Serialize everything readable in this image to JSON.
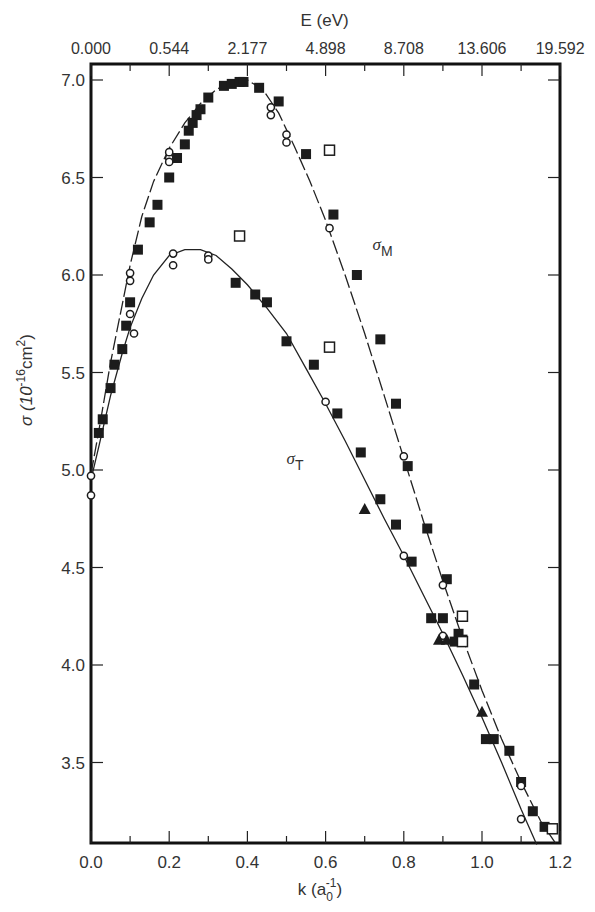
{
  "chart_data": {
    "type": "scatter",
    "title": "",
    "xlabel": "k (a0^-1)",
    "xlabel_main": "k (a",
    "xlabel_sub": "0",
    "xlabel_sup": "-1",
    "xlabel_close": ")",
    "ylabel": "σ (10^-16 cm^2)",
    "ylabel_main": "σ (10",
    "ylabel_sup": "-16",
    "ylabel_unit": "cm",
    "ylabel_unit_sup": "2",
    "ylabel_close": ")",
    "top_axis_label": "E (eV)",
    "xlim": [
      0.0,
      1.2
    ],
    "ylim": [
      3.1,
      7.1
    ],
    "grid": false,
    "x_ticks": [
      "0.0",
      "0.2",
      "0.4",
      "0.6",
      "0.8",
      "1.0",
      "1.2"
    ],
    "x_tick_values": [
      0.0,
      0.2,
      0.4,
      0.6,
      0.8,
      1.0,
      1.2
    ],
    "y_ticks": [
      "3.5",
      "4.0",
      "4.5",
      "5.0",
      "5.5",
      "6.0",
      "6.5",
      "7.0"
    ],
    "y_tick_values": [
      3.5,
      4.0,
      4.5,
      5.0,
      5.5,
      6.0,
      6.5,
      7.0
    ],
    "top_ticks": [
      "0.000",
      "0.544",
      "2.177",
      "4.898",
      "8.708",
      "13.606",
      "19.592"
    ],
    "top_tick_k": [
      0.0,
      0.2,
      0.4,
      0.6,
      0.8,
      1.0,
      1.2
    ],
    "annotations": [
      {
        "text": "σ",
        "sub": "M",
        "x": 0.72,
        "y": 6.13
      },
      {
        "text": "σ",
        "sub": "T",
        "x": 0.5,
        "y": 5.03
      }
    ],
    "curves": [
      {
        "name": "σM fit",
        "style": "dashed-solid",
        "x": [
          0.0,
          0.02,
          0.05,
          0.08,
          0.1,
          0.13,
          0.16,
          0.2,
          0.24,
          0.28,
          0.32,
          0.36,
          0.4,
          0.44,
          0.48,
          0.52,
          0.56,
          0.6,
          0.65,
          0.7,
          0.75,
          0.8,
          0.85,
          0.9,
          0.95,
          1.0,
          1.05,
          1.1,
          1.15,
          1.19
        ],
        "y": [
          4.98,
          5.2,
          5.55,
          5.85,
          6.05,
          6.3,
          6.48,
          6.65,
          6.78,
          6.88,
          6.95,
          6.99,
          7.0,
          6.95,
          6.83,
          6.66,
          6.48,
          6.28,
          6.0,
          5.7,
          5.38,
          5.06,
          4.74,
          4.43,
          4.14,
          3.87,
          3.62,
          3.4,
          3.2,
          3.08
        ]
      },
      {
        "name": "σT fit",
        "style": "solid",
        "x": [
          0.0,
          0.02,
          0.05,
          0.08,
          0.1,
          0.13,
          0.16,
          0.2,
          0.24,
          0.28,
          0.32,
          0.36,
          0.4,
          0.45,
          0.5,
          0.55,
          0.6,
          0.65,
          0.7,
          0.75,
          0.8,
          0.85,
          0.9,
          0.95,
          1.0,
          1.05,
          1.1,
          1.14
        ],
        "y": [
          4.95,
          5.12,
          5.38,
          5.6,
          5.73,
          5.88,
          6.0,
          6.1,
          6.13,
          6.13,
          6.1,
          6.03,
          5.95,
          5.83,
          5.7,
          5.52,
          5.34,
          5.15,
          4.95,
          4.75,
          4.56,
          4.36,
          4.16,
          3.95,
          3.73,
          3.5,
          3.26,
          3.08
        ]
      }
    ],
    "series": [
      {
        "name": "σM filled squares",
        "marker": "filled-square",
        "x": [
          0.02,
          0.03,
          0.05,
          0.06,
          0.08,
          0.09,
          0.1,
          0.12,
          0.15,
          0.17,
          0.2,
          0.22,
          0.24,
          0.25,
          0.26,
          0.27,
          0.28,
          0.3,
          0.34,
          0.36,
          0.38,
          0.39,
          0.43,
          0.48,
          0.55,
          0.62,
          0.68,
          0.74,
          0.78,
          0.81,
          0.86,
          0.91,
          0.94,
          0.95,
          0.98,
          1.03,
          1.07,
          1.13
        ],
        "y": [
          5.19,
          5.26,
          5.42,
          5.54,
          5.62,
          5.74,
          5.86,
          6.13,
          6.27,
          6.36,
          6.5,
          6.6,
          6.67,
          6.74,
          6.78,
          6.82,
          6.85,
          6.91,
          6.97,
          6.98,
          6.99,
          6.99,
          6.96,
          6.89,
          6.62,
          6.31,
          6.0,
          5.67,
          5.34,
          5.02,
          4.7,
          4.44,
          4.16,
          4.13,
          3.9,
          3.62,
          3.56,
          3.25
        ]
      },
      {
        "name": "σT filled squares",
        "marker": "filled-square",
        "x": [
          0.37,
          0.42,
          0.45,
          0.5,
          0.57,
          0.63,
          0.69,
          0.74,
          0.78,
          0.82,
          0.87,
          0.9,
          0.93,
          1.01,
          1.1,
          1.16
        ],
        "y": [
          5.96,
          5.9,
          5.86,
          5.66,
          5.54,
          5.29,
          5.09,
          4.85,
          4.72,
          4.53,
          4.24,
          4.24,
          4.12,
          3.62,
          3.4,
          3.17
        ]
      },
      {
        "name": "open circles",
        "marker": "open-circle",
        "x": [
          0.0,
          0.0,
          0.1,
          0.1,
          0.1,
          0.11,
          0.2,
          0.2,
          0.21,
          0.21,
          0.2,
          0.3,
          0.3,
          0.46,
          0.46,
          0.5,
          0.5,
          0.61,
          0.6,
          0.8,
          0.8,
          0.9,
          0.9,
          1.1,
          1.1
        ],
        "y": [
          4.97,
          4.87,
          5.97,
          6.01,
          5.8,
          5.7,
          6.6,
          6.63,
          6.11,
          6.05,
          6.58,
          6.1,
          6.08,
          6.82,
          6.86,
          6.72,
          6.68,
          6.24,
          5.35,
          5.07,
          4.56,
          4.41,
          4.15,
          3.38,
          3.21
        ]
      },
      {
        "name": "open squares",
        "marker": "open-square",
        "x": [
          0.38,
          0.61,
          0.61,
          0.95,
          0.95,
          1.18
        ],
        "y": [
          6.2,
          6.64,
          5.63,
          4.25,
          4.12,
          3.16
        ]
      },
      {
        "name": "filled triangles",
        "marker": "filled-triangle",
        "x": [
          0.7,
          0.89,
          0.91,
          1.0
        ],
        "y": [
          4.8,
          4.13,
          4.13,
          3.76
        ]
      }
    ]
  }
}
